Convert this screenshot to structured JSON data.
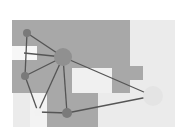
{
  "diagram": {
    "type": "network-graph-over-regions",
    "width": 181,
    "height": 133,
    "colors": {
      "background": "#ffffff",
      "light_region": "#ebebeb",
      "dark_region": "#a8a8a8",
      "edge": "#555555",
      "node_dark": "#7a7a7a",
      "node_hub": "#909090",
      "node_light": "#e4e4e4",
      "node_pale": "#f2f2f2"
    },
    "regions": [
      {
        "id": "light-area",
        "x": 13,
        "y": 20,
        "w": 162,
        "h": 107,
        "shade": "light"
      },
      {
        "id": "dark-area-top",
        "x": 12,
        "y": 20,
        "w": 118,
        "h": 73,
        "shade": "dark"
      },
      {
        "id": "dark-step",
        "x": 123,
        "y": 66,
        "w": 20,
        "h": 14,
        "shade": "dark"
      },
      {
        "id": "white-notch",
        "x": 12,
        "y": 46,
        "w": 25,
        "h": 14,
        "shade": "white"
      },
      {
        "id": "white-inset",
        "x": 72,
        "y": 68,
        "w": 40,
        "h": 25,
        "shade": "lightest"
      },
      {
        "id": "dark-area-bottom",
        "x": 47,
        "y": 93,
        "w": 51,
        "h": 34,
        "shade": "dark"
      }
    ],
    "nodes": [
      {
        "id": "n1",
        "x": 27,
        "y": 33,
        "r": 4,
        "shade": "dark"
      },
      {
        "id": "hub",
        "x": 63,
        "y": 57,
        "r": 9,
        "shade": "hub"
      },
      {
        "id": "n3",
        "x": 25,
        "y": 76,
        "r": 4,
        "shade": "dark"
      },
      {
        "id": "n4",
        "x": 38,
        "y": 112,
        "r": 4,
        "shade": "pale"
      },
      {
        "id": "n5",
        "x": 67,
        "y": 113,
        "r": 5,
        "shade": "dark"
      },
      {
        "id": "n6",
        "x": 153,
        "y": 96,
        "r": 10,
        "shade": "light"
      }
    ],
    "edges": [
      [
        "n1",
        "hub"
      ],
      [
        "n1",
        "n3"
      ],
      [
        "hub",
        "n3"
      ],
      [
        "hub",
        "n4"
      ],
      [
        "hub",
        "n5"
      ],
      [
        "hub",
        "n6"
      ],
      [
        "n3",
        "n4"
      ],
      [
        "n4",
        "n5"
      ],
      [
        "n5",
        "n6"
      ],
      [
        "hub",
        "notch"
      ]
    ]
  }
}
